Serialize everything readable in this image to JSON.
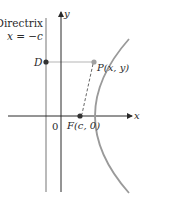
{
  "diagram": {
    "labels": {
      "directrix_line1": "Directrix",
      "directrix_line2": "x = −c",
      "y_axis": "y",
      "x_axis": "x",
      "origin": "0",
      "point_d": "D",
      "point_p": "P(x, y)",
      "point_f": "F(c, 0)"
    },
    "colors": {
      "curve": "#9a9a9a",
      "axes": "#2a2a2a",
      "directrix": "#8c8c8c",
      "guide_line": "#b5b5b5",
      "dashed_segment": "#555555",
      "points_dark": "#333333",
      "point_p": "#a0a0a0"
    },
    "geometry": {
      "origin": [
        61,
        116
      ],
      "directrix_x": 46,
      "focus": [
        83,
        116
      ],
      "point_p": [
        94,
        62
      ],
      "point_d": [
        46,
        62
      ]
    }
  }
}
